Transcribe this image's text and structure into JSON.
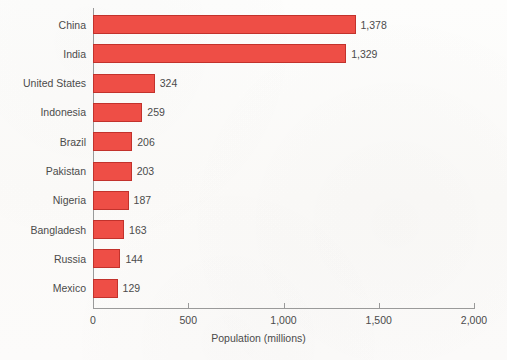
{
  "chart_data": {
    "type": "bar",
    "orientation": "horizontal",
    "title": "",
    "xlabel": "Population (millions)",
    "ylabel": "",
    "xlim": [
      0,
      2000
    ],
    "grid": false,
    "legend": null,
    "xticks": [
      {
        "value": 0,
        "label": "0"
      },
      {
        "value": 500,
        "label": "500"
      },
      {
        "value": 1000,
        "label": "1,000"
      },
      {
        "value": 1500,
        "label": "1,500"
      },
      {
        "value": 2000,
        "label": "2,000"
      }
    ],
    "categories": [
      "China",
      "India",
      "United States",
      "Indonesia",
      "Brazil",
      "Pakistan",
      "Nigeria",
      "Bangladesh",
      "Russia",
      "Mexico"
    ],
    "values": [
      1378,
      1329,
      324,
      259,
      206,
      203,
      187,
      163,
      144,
      129
    ],
    "value_labels": [
      "1,378",
      "1,329",
      "324",
      "259",
      "206",
      "203",
      "187",
      "163",
      "144",
      "129"
    ],
    "colors": {
      "bar_fill": "#ee4e46",
      "bar_border": "#c2322c",
      "axis": "#9a9a9a",
      "text": "#4b4b4b",
      "background": "#fdfcfb"
    }
  }
}
